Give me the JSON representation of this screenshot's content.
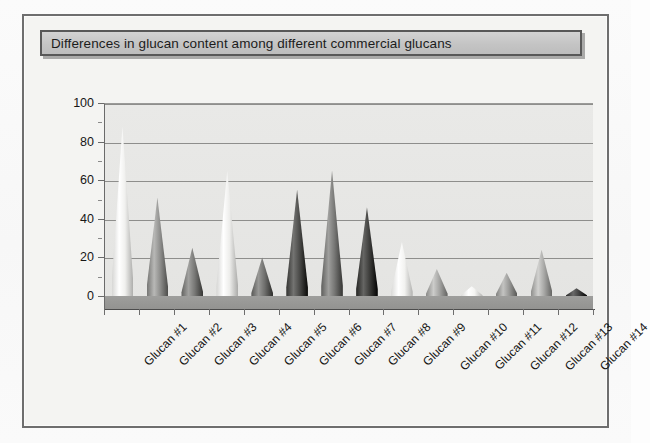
{
  "chart_data": {
    "type": "bar",
    "subtype": "3d-cone-column",
    "title": "Differences in glucan content among different commercial glucans",
    "xlabel": "",
    "ylabel": "",
    "categories": [
      "Glucan #1",
      "Glucan #2",
      "Glucan #3",
      "Glucan #4",
      "Glucan #5",
      "Glucan #6",
      "Glucan #7",
      "Glucan #8",
      "Glucan #9",
      "Glucan #10",
      "Glucan #11",
      "Glucan #12",
      "Glucan #13",
      "Glucan #14"
    ],
    "values": [
      88,
      51,
      25,
      65,
      20,
      55,
      65,
      46,
      28,
      14,
      5,
      12,
      24,
      4
    ],
    "series": [
      {
        "name": "Glucan content",
        "values": [
          88,
          51,
          25,
          65,
          20,
          55,
          65,
          46,
          28,
          14,
          5,
          12,
          24,
          4
        ]
      }
    ],
    "ylim": [
      0,
      100
    ],
    "y_ticks": [
      0,
      20,
      40,
      60,
      80,
      100
    ],
    "y_tick_labels": [
      "0",
      "20",
      "40",
      "60",
      "80",
      "100"
    ],
    "grid": true,
    "legend": false,
    "legend_position": "none",
    "colors": [
      "#f0f0ee",
      "#8f8f8d",
      "#787876",
      "#ededeb",
      "#6f6f6d",
      "#4a4a48",
      "#767674",
      "#3c3c3a",
      "#f2f2f0",
      "#a3a3a1",
      "#f4f4f2",
      "#9a9a98",
      "#a8a8a6",
      "#404040"
    ]
  },
  "chart": {
    "plot_background": "#e7e7e5",
    "floor_color": "#9a9a98",
    "frame_border": "#6e6e6e",
    "title_box_fill": "#c8c8c8",
    "title_box_border": "#585858",
    "gridline_color": "#8e8e8c",
    "axis_color": "#4c4c4c"
  }
}
